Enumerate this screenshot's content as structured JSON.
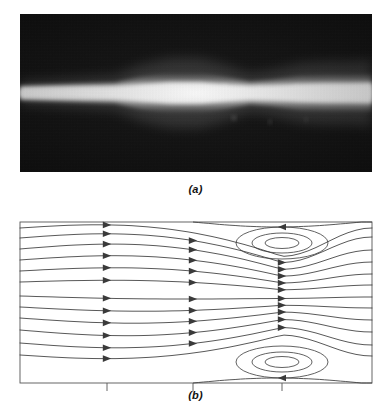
{
  "figure": {
    "width": 391,
    "height": 414,
    "background": "#ffffff",
    "line_color": "#3a3a3a",
    "frame_color": "#555555",
    "photo_background": "#0a0a0a",
    "jet_color": "#ffffff"
  },
  "panels": [
    {
      "id": "a",
      "caption": "(a)",
      "type": "photograph",
      "description": "Black-background flow-visualization photograph of a bright illuminated jet",
      "frame": {
        "x": 20,
        "y": 14,
        "width": 352,
        "height": 158
      },
      "jet": {
        "centerline_y": 93,
        "color": "#ffffff",
        "profile_note": "thin at inlet, bulges in the mid-left, pinches, widens toward the outlet",
        "half_thickness_points": [
          {
            "x": 0,
            "half": 7
          },
          {
            "x": 30,
            "half": 8
          },
          {
            "x": 60,
            "half": 9
          },
          {
            "x": 95,
            "half": 10
          },
          {
            "x": 120,
            "half": 16
          },
          {
            "x": 150,
            "half": 20
          },
          {
            "x": 180,
            "half": 20
          },
          {
            "x": 205,
            "half": 16
          },
          {
            "x": 230,
            "half": 11
          },
          {
            "x": 252,
            "half": 13
          },
          {
            "x": 280,
            "half": 17
          },
          {
            "x": 305,
            "half": 18
          },
          {
            "x": 330,
            "half": 18
          },
          {
            "x": 352,
            "half": 19
          }
        ]
      }
    },
    {
      "id": "b",
      "caption": "(b)",
      "type": "streamline-diagram",
      "description": "Computed streamline pattern with two counter-rotating recirculation vortices near the right wall",
      "frame": {
        "x": 20,
        "y": 222,
        "width": 352,
        "height": 161
      },
      "arrow_columns_x": [
        107,
        193,
        282
      ],
      "tick_marks_x": [
        107,
        193,
        282
      ],
      "tick_length": 8,
      "streamline_count": 12,
      "vortices": [
        {
          "name": "upper-recirculation",
          "center_x": 282,
          "center_y": 243,
          "rotation": "clockwise",
          "loops": 3
        },
        {
          "name": "lower-recirculation",
          "center_x": 282,
          "center_y": 362,
          "rotation": "counter-clockwise",
          "loops": 3
        }
      ]
    }
  ],
  "chart_data": {
    "type": "line",
    "title": "",
    "subtitle": "",
    "xlabel": "",
    "ylabel": "",
    "xlim": [
      20,
      372
    ],
    "ylim": [
      222,
      383
    ],
    "grid": false,
    "legend": null,
    "annotations": [
      "(a)",
      "(b)"
    ],
    "series": [
      {
        "name": "streamline-1",
        "y0": 228,
        "amp": -5.5,
        "y_right": 228
      },
      {
        "name": "streamline-2",
        "y0": 238,
        "amp": -6.5,
        "y_right": 237
      },
      {
        "name": "streamline-3",
        "y0": 249,
        "amp": -7.0,
        "y_right": 250
      },
      {
        "name": "streamline-4",
        "y0": 260,
        "amp": -6.0,
        "y_right": 262
      },
      {
        "name": "streamline-5",
        "y0": 271,
        "amp": -4.5,
        "y_right": 274
      },
      {
        "name": "streamline-6",
        "y0": 282,
        "amp": -2.5,
        "y_right": 285
      },
      {
        "name": "streamline-7",
        "y0": 296,
        "amp": 2.5,
        "y_right": 297
      },
      {
        "name": "streamline-8",
        "y0": 307,
        "amp": 4.5,
        "y_right": 308
      },
      {
        "name": "streamline-9",
        "y0": 318,
        "amp": 6.0,
        "y_right": 320
      },
      {
        "name": "streamline-10",
        "y0": 330,
        "amp": 7.0,
        "y_right": 332
      },
      {
        "name": "streamline-11",
        "y0": 343,
        "amp": 6.5,
        "y_right": 345
      },
      {
        "name": "streamline-12",
        "y0": 355,
        "amp": 5.5,
        "y_right": 356
      }
    ]
  }
}
